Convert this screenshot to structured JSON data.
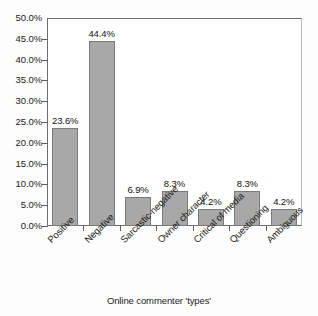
{
  "chart_data": {
    "type": "bar",
    "title": "",
    "xlabel": "Online commenter 'types'",
    "ylabel": "",
    "categories": [
      "Positive",
      "Negative",
      "Sarcastic-negative",
      "Owner character",
      "Critical of media",
      "Questioning",
      "Ambiguous"
    ],
    "values": [
      23.6,
      44.4,
      6.9,
      8.3,
      4.2,
      8.3,
      4.2
    ],
    "data_labels": [
      "23.6%",
      "44.4%",
      "6.9%",
      "8.3%",
      "4.2%",
      "8.3%",
      "4.2%"
    ],
    "ylim": [
      0,
      50
    ],
    "ytick_values": [
      0,
      5,
      10,
      15,
      20,
      25,
      30,
      35,
      40,
      45,
      50
    ],
    "ytick_labels": [
      "0.0%",
      "5.0%",
      "10.0%",
      "15.0%",
      "20.0%",
      "25.0%",
      "30.0%",
      "35.0%",
      "40.0%",
      "45.0%",
      "50.0%"
    ],
    "grid": false,
    "legend": false,
    "bar_color": "#a8a8a8",
    "bar_edge_color": "#7a7a7a",
    "axis_color": "#6e6e6e",
    "text_color": "#1b1b1b",
    "background_color": "#ffffff"
  }
}
